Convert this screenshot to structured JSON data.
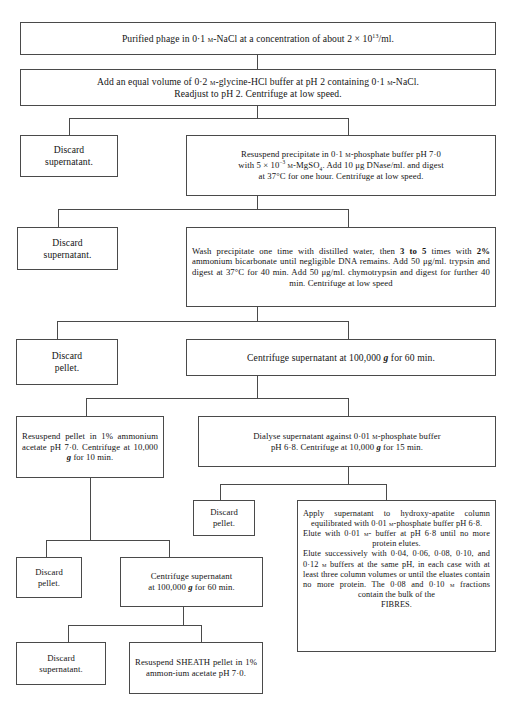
{
  "boxes": [
    {
      "id": "b1",
      "name": "step-purified-phage",
      "html": "Purified phage in 0·1 <span class=\"sc\">m</span>-NaCl at a concentration of about 2 × 10<sup>13</sup>/ml.",
      "text": "Purified phage in 0·1 m-NaCl at a concentration of about 2 × 10¹³/ml."
    },
    {
      "id": "b2",
      "name": "step-add-glycine-hcl",
      "html": "Add an equal volume of 0·2 <span class=\"sc\">m</span>-glycine-HCl buffer at pH 2 containing 0·1 <span class=\"sc\">m</span>-NaCl.<br>Readjust to pH 2. Centrifuge at low speed.",
      "text": "Add an equal volume of 0·2 m-glycine-HCl buffer at pH 2 containing 0·1 m-NaCl. Readjust to pH 2. Centrifuge at low speed."
    },
    {
      "id": "b3",
      "name": "discard-supernatant-1",
      "html": "Discard<br>supernatant.",
      "text": "Discard supernatant."
    },
    {
      "id": "b4",
      "name": "step-resuspend-precipitate-phosphate",
      "html": "Resuspend precipitate in 0·1 <span class=\"sc\">m</span>-phosphate buffer pH 7·0<br>with 5 × 10<sup>−3</sup> <span class=\"sc\">m</span>-MgSO<sub>4</sub>. Add 10 μg DNase/ml. and digest<br>at 37°C for one hour. Centrifuge at low speed.",
      "text": "Resuspend precipitate in 0·1 m-phosphate buffer pH 7·0 with 5 × 10⁻³ m-MgSO4. Add 10 μg DNase/ml. and digest at 37°C for one hour. Centrifuge at low speed."
    },
    {
      "id": "b5",
      "name": "discard-supernatant-2",
      "html": "Discard<br>supernatant.",
      "text": "Discard supernatant."
    },
    {
      "id": "b6",
      "name": "step-wash-precipitate-trypsin",
      "html": "Wash precipitate one time with distilled water, then <span class=\"bold\">3 to 5</span> times with <span class=\"bold\">2%</span> ammonium bicarbonate until negligible DNA remains. Add 50 μg/ml. trypsin and digest at 37°C for 40 min. Add 50 μg/ml. chymotrypsin and digest for further 40 min. Centrifuge at low speed",
      "text": "Wash precipitate one time with distilled water, then 3 to 5 times with 2% ammonium bicarbonate until negligible DNA remains. Add 50 μg/ml. trypsin and digest at 37°C for 40 min. Add 50 μg/ml. chymotrypsin and digest for further 40 min. Centrifuge at low speed"
    },
    {
      "id": "b7",
      "name": "discard-pellet-1",
      "html": "Discard<br>pellet.",
      "text": "Discard pellet."
    },
    {
      "id": "b8",
      "name": "step-centrifuge-100000g-60min-1",
      "html": "Centrifuge supernatant at 100,000 <span class=\"ital\">g</span> for 60 min.",
      "text": "Centrifuge supernatant at 100,000 g for 60 min."
    },
    {
      "id": "b9",
      "name": "step-resuspend-pellet-ammonium-acetate",
      "html": "Resuspend pellet in 1% ammonium acetate pH 7·0. Centrifuge at 10,000 <span class=\"ital\">g</span> for 10 min.",
      "text": "Resuspend pellet in 1% ammonium acetate pH 7·0. Centrifuge at 10,000 g for 10 min."
    },
    {
      "id": "b10",
      "name": "step-dialyse-supernatant",
      "html": "Dialyse supernatant against 0·01 <span class=\"sc\">m</span>-phosphate buffer<br>pH 6·8. Centrifuge at 10,000 <span class=\"ital\">g</span> for 15 min.",
      "text": "Dialyse supernatant against 0·01 m-phosphate buffer pH 6·8. Centrifuge at 10,000 g for 15 min."
    },
    {
      "id": "b11",
      "name": "discard-pellet-2",
      "html": "Discard<br>pellet.",
      "text": "Discard pellet."
    },
    {
      "id": "b12",
      "name": "step-hydroxyapatite-column",
      "html": "Apply supernatant to hydroxy-apatite column equilibrated with 0·01 <span class=\"sc\">m</span>-phosphate buffer pH 6·8.<br>Elute with 0·01 <span class=\"sc\">m</span>- buffer at pH 6·8 until no more protein elutes.<br>Elute successively with 0·04, 0·06, 0·08, 0·10, and 0·12 <span class=\"sc\">m</span> buffers at the same pH, in each case with at least three column volumes or until the eluates contain no more protein. The 0·08 and 0·10 <span class=\"sc\">m</span> fractions contain the bulk of the <span style=\"display:block;text-align:center\">FIBRES.</span>",
      "text": "Apply supernatant to hydroxyapatite column equilibrated with 0·01 m-phosphate buffer pH 6·8. Elute with 0·01 m- buffer at pH 6·8 until no more protein elutes. Elute successively with 0·04, 0·06, 0·08, 0·10, and 0·12 m buffers at the same pH, in each case with at least three column volumes or until the eluates contain no more protein. The 0·08 and 0·10 m fractions contain the bulk of the FIBRES."
    },
    {
      "id": "b13",
      "name": "discard-pellet-3",
      "html": "Discard<br>pellet.",
      "text": "Discard pellet."
    },
    {
      "id": "b14",
      "name": "step-centrifuge-100000g-60min-2",
      "html": "Centrifuge supernatant<br>at 100,000 <span class=\"ital\">g</span> for 60 min.",
      "text": "Centrifuge supernatant at 100,000 g for 60 min."
    },
    {
      "id": "b15",
      "name": "discard-supernatant-3",
      "html": "Discard<br>supernatant.",
      "text": "Discard supernatant."
    },
    {
      "id": "b16",
      "name": "step-resuspend-sheath-pellet",
      "html": "Resuspend SHEATH pellet in 1% ammon-ium acetate pH 7·0.",
      "text": "Resuspend SHEATH pellet in 1% ammonium acetate pH 7·0."
    }
  ]
}
